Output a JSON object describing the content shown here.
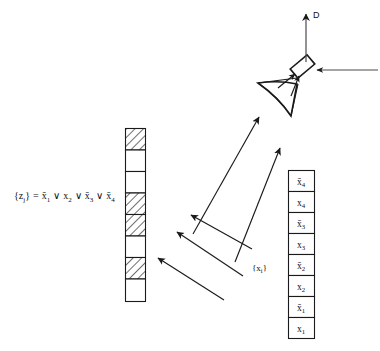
{
  "figure": {
    "equation": {
      "lhs": "{z",
      "lhs_sub": "j",
      "lhs_close": "}",
      "eq": "=",
      "terms": [
        {
          "text": "x̄",
          "sub": "1"
        },
        {
          "text": "x",
          "sub": "2"
        },
        {
          "text": "x̄",
          "sub": "3"
        },
        {
          "text": "x̄",
          "sub": "4"
        }
      ],
      "operator": "∨",
      "full": "{z_j} = x̄1 ∨ x2 ∨ x̄3 ∨ x̄4"
    },
    "mask_column": {
      "name": "mask-column",
      "cells": [
        {
          "index": 0,
          "state": "hatched"
        },
        {
          "index": 1,
          "state": "clear"
        },
        {
          "index": 2,
          "state": "clear"
        },
        {
          "index": 3,
          "state": "hatched"
        },
        {
          "index": 4,
          "state": "hatched"
        },
        {
          "index": 5,
          "state": "clear"
        },
        {
          "index": 6,
          "state": "hatched"
        },
        {
          "index": 7,
          "state": "clear"
        }
      ]
    },
    "input_column": {
      "name": "input-column",
      "label": "{x",
      "label_sub": "i",
      "label_close": "}",
      "cells": [
        {
          "index": 0,
          "text": "x̄",
          "sub": "4"
        },
        {
          "index": 1,
          "text": "x",
          "sub": "4"
        },
        {
          "index": 2,
          "text": "x̄",
          "sub": "3"
        },
        {
          "index": 3,
          "text": "x",
          "sub": "3"
        },
        {
          "index": 4,
          "text": "x̄",
          "sub": "2"
        },
        {
          "index": 5,
          "text": "x",
          "sub": "2"
        },
        {
          "index": 6,
          "text": "x̄",
          "sub": "1"
        },
        {
          "index": 7,
          "text": "x",
          "sub": "1"
        }
      ]
    },
    "detector": {
      "name": "detector-output",
      "label": "D"
    },
    "rays": {
      "count": 5,
      "direction": "up-right"
    },
    "colors": {
      "ink": "#1a1a1a",
      "paper": "#ffffff",
      "thin": "#4a4a4a"
    }
  }
}
